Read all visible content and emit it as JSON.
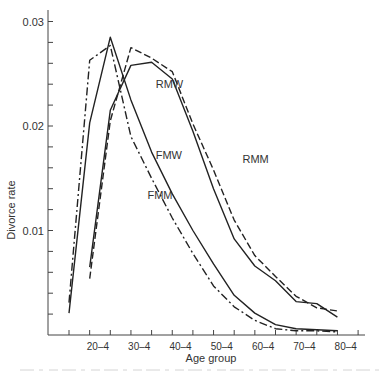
{
  "chart_data": {
    "type": "line",
    "title": "",
    "xlabel": "Age group",
    "ylabel": "Divorce rate",
    "ylim": [
      0,
      0.031
    ],
    "yticks": [
      0.01,
      0.02,
      0.03
    ],
    "ytick_labels": [
      "0.01",
      "0.02",
      "0.03"
    ],
    "y_minor_step": 0.002,
    "x_tick_labels": [
      "20–4",
      "30–4",
      "40–4",
      "50–4",
      "60–4",
      "70–4",
      "80–4"
    ],
    "x_minor_ticks": [
      15,
      20,
      25,
      30,
      35,
      40,
      45,
      50,
      55,
      60,
      65,
      70,
      75,
      80,
      85
    ],
    "grid": false,
    "legend": "inline labels",
    "series": [
      {
        "name": "FMW",
        "style": "solid",
        "x": [
          15,
          20,
          25,
          30,
          35,
          40,
          45,
          50,
          55,
          60,
          65,
          70,
          75,
          80
        ],
        "values": [
          0.0021,
          0.0203,
          0.0285,
          0.0225,
          0.0175,
          0.0135,
          0.01,
          0.0068,
          0.0038,
          0.0021,
          0.001,
          0.0006,
          0.0005,
          0.0004
        ]
      },
      {
        "name": "FMM",
        "style": "dash-dot",
        "x": [
          15,
          20,
          25,
          30,
          35,
          40,
          45,
          50,
          55,
          60,
          65,
          70,
          75,
          80
        ],
        "values": [
          0.0031,
          0.0263,
          0.0277,
          0.019,
          0.015,
          0.0112,
          0.0078,
          0.0047,
          0.0027,
          0.0014,
          0.0006,
          0.0004,
          0.0004,
          0.0003
        ]
      },
      {
        "name": "RMW",
        "style": "solid",
        "x": [
          20,
          25,
          30,
          35,
          40,
          45,
          50,
          55,
          60,
          65,
          70,
          75,
          80
        ],
        "values": [
          0.0065,
          0.0215,
          0.0258,
          0.0261,
          0.0245,
          0.0195,
          0.014,
          0.0092,
          0.0066,
          0.0052,
          0.0032,
          0.003,
          0.0017
        ]
      },
      {
        "name": "RMM",
        "style": "dashed",
        "x": [
          20,
          25,
          30,
          35,
          40,
          45,
          50,
          55,
          60,
          65,
          70,
          75,
          80
        ],
        "values": [
          0.0054,
          0.0205,
          0.0275,
          0.0265,
          0.0252,
          0.0202,
          0.0158,
          0.011,
          0.0076,
          0.0056,
          0.0037,
          0.0026,
          0.0023
        ]
      }
    ],
    "annotations": [
      {
        "text": "RMW",
        "x": 36,
        "y": 0.0236
      },
      {
        "text": "FMW",
        "x": 36,
        "y": 0.0168
      },
      {
        "text": "FMM",
        "x": 34,
        "y": 0.013
      },
      {
        "text": "RMM",
        "x": 57,
        "y": 0.0165
      }
    ]
  },
  "caption_fragment": ""
}
